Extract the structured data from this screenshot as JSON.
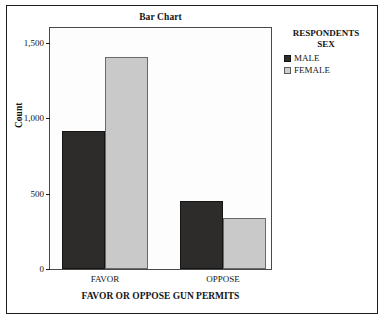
{
  "chart_data": {
    "type": "bar",
    "title": "Bar Chart",
    "xlabel": "FAVOR OR OPPOSE GUN PERMITS",
    "ylabel": "Count",
    "categories": [
      "FAVOR",
      "OPPOSE"
    ],
    "series": [
      {
        "name": "MALE",
        "color": "#2e2b2b",
        "values": [
          915,
          450
        ]
      },
      {
        "name": "FEMALE",
        "color": "#c9c9c9",
        "values": [
          1408,
          340
        ]
      }
    ],
    "yticks": [
      "0",
      "500",
      "1,000",
      "1,500"
    ],
    "ytick_values": [
      0,
      500,
      1000,
      1500
    ],
    "ylim": [
      0,
      1600
    ],
    "grid": false,
    "legend_position": "right"
  },
  "legend": {
    "title_line1": "RESPONDENTS",
    "title_line2": "SEX",
    "items": [
      {
        "label": "MALE",
        "swatch": "male-swatch"
      },
      {
        "label": "FEMALE",
        "swatch": "female-swatch"
      }
    ]
  }
}
